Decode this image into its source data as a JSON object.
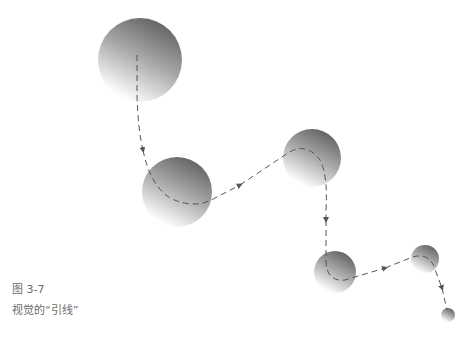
{
  "caption": {
    "figure_number": "图 3-7",
    "title": "视觉的“引线”"
  },
  "colors": {
    "sphere_dark": "#6e6e6e",
    "sphere_light": "#ffffff",
    "path": "#555555",
    "caption_text": "#6a6a6a"
  },
  "spheres": [
    {
      "cx": 140,
      "cy": 60,
      "r": 42
    },
    {
      "cx": 177,
      "cy": 192,
      "r": 35
    },
    {
      "cx": 312,
      "cy": 158,
      "r": 29
    },
    {
      "cx": 335,
      "cy": 272,
      "r": 21
    },
    {
      "cx": 425,
      "cy": 259,
      "r": 14
    },
    {
      "cx": 448,
      "cy": 315,
      "r": 7
    }
  ]
}
